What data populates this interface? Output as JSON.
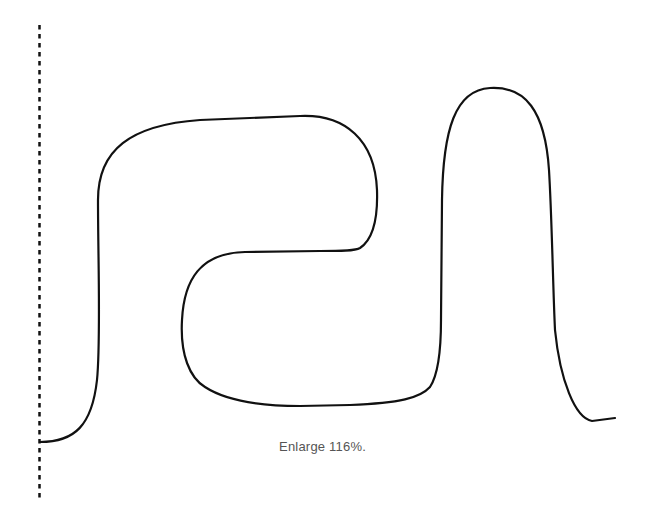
{
  "figure": {
    "caption": "Enlarge 116%.",
    "stroke_color": "#111111",
    "guide_color": "#111111",
    "background": "#ffffff"
  },
  "guide_line": {
    "style": "dashed",
    "x": 39.5,
    "y_start": 25,
    "y_end": 498
  },
  "curve": {
    "description": "continuous meandering line starting at left dashed guide and ending at right",
    "start": [
      40,
      442
    ],
    "end": [
      615,
      418
    ]
  }
}
